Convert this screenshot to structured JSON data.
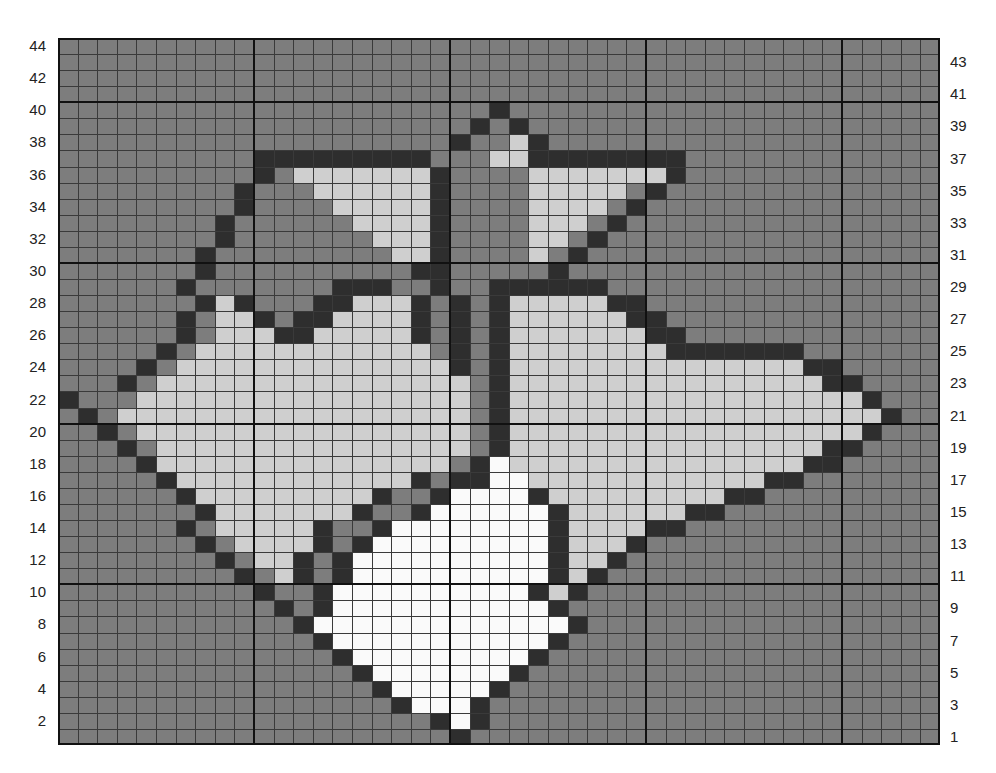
{
  "chart_title": "Maple Leaf Pinwheel Knitting Chart",
  "chart_data": {
    "type": "heatmap",
    "xlabel": "",
    "ylabel": "",
    "grid": true,
    "legend_position": "none",
    "columns": 45,
    "rows": 44,
    "cell_px": 19.6,
    "heavy_line_every": 10,
    "row_axis_left_label_parity": "even",
    "row_axis_right_label_parity": "odd",
    "left_ticks": [
      44,
      42,
      40,
      38,
      36,
      34,
      32,
      30,
      28,
      26,
      24,
      22,
      20,
      18,
      16,
      14,
      12,
      10,
      8,
      6,
      4,
      2
    ],
    "right_ticks": [
      43,
      41,
      39,
      37,
      35,
      33,
      31,
      29,
      27,
      25,
      23,
      21,
      19,
      17,
      15,
      13,
      11,
      9,
      7,
      5,
      3,
      1
    ],
    "palette": {
      "background": "#7d7d7d",
      "dark": "#2e2e2e",
      "light": "#cfcfcf",
      "white": "#fafafa",
      "gridline": "#3a3a3a",
      "heavyline": "#111111",
      "border": "#111111",
      "page": "#ffffff",
      "tick_text": "#222222"
    },
    "symbols": {
      "0": "background",
      "1": "dark",
      "2": "light",
      "3": "white"
    },
    "rows_top_to_bottom": [
      "000000000000000000000000000000000000000000000",
      "000000000000000000000000000000000000000000000",
      "000000000000000000000000000000000000000000000",
      "000000000000000000000000000000000000000000000",
      "000000000000000000000010000000000000000000000",
      "000000000000000000000101000000000000000000000",
      "000000000000000000001002100000000000000000000",
      "000000000011111111100022111111110000000000000",
      "000000000010222222210000222222210000000000000",
      "000000000100022222210000222220100000000000000",
      "000000000100002222210000222201000000000000000",
      "000000001000000222210000222010000000000000000",
      "000000001000000022210000220100000000000000000",
      "000000010000000002210000201000000000000000000",
      "000000010000000000110000010000000000000000000",
      "000000100000001110010011111100000000000000000",
      "000000012100011222101012222211000000000000000",
      "000000102210112222101012222221100000000000000",
      "000000102221122222101012222222110000000000000",
      "000001022222222222201012222222211111110000000",
      "000010222222222222221012222222222222221100000",
      "000102222222222222222012222222222222222110000",
      "100022222222222222222012222222222222222221000",
      "010222222222222222222012222222222222222222100",
      "001022222222222222222012222222222222222221000",
      "000102222222222222222012222222222222222110000",
      "000012222222222222220132222222222222221100000",
      "000001222222222222101133222222222222110000000",
      "000000122222222210013333122222222211000000000",
      "000000012222222100133333312222221100000000000",
      "000000102222210013333333312222110000000000000",
      "000000010222210133333333312221000000000000000",
      "000000001022101333333333312210000000000000000",
      "000000000102101333333333312100000000000000000",
      "000000000010013333333333121000000000000000000",
      "000000000001013333333333310000000000000000000",
      "000000000000133333333333331000000000000000000",
      "000000000000013333333333310000000000000000000",
      "000000000000001333333333100000000000000000000",
      "000000000000000133333331000000000000000000000",
      "000000000000000013333310000000000000000000000",
      "000000000000000001333100000000000000000000000",
      "000000000000000000013100000000000000000000000",
      "000000000000000000001000000000000000000000000"
    ]
  }
}
